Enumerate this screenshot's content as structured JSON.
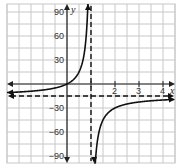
{
  "chart_data": {
    "type": "line",
    "title": "",
    "xlabel": "x",
    "ylabel": "y",
    "xlim": [
      -2.5,
      4.5
    ],
    "ylim": [
      -105,
      105
    ],
    "grid": true,
    "x_ticks": [
      {
        "value": 1,
        "label": ""
      },
      {
        "value": 2,
        "label": "2"
      },
      {
        "value": 3,
        "label": "3"
      },
      {
        "value": 4,
        "label": "4"
      }
    ],
    "y_ticks": [
      {
        "value": 90,
        "label": "90"
      },
      {
        "value": 60,
        "label": "60"
      },
      {
        "value": 30,
        "label": "30"
      },
      {
        "value": -30,
        "label": "−30"
      },
      {
        "value": -60,
        "label": "−60"
      },
      {
        "value": -90,
        "label": "−90"
      }
    ],
    "function": "y = -15x/(x-1)",
    "asymptotes": {
      "vertical": {
        "x": 1,
        "style": "dashed"
      },
      "horizontal": {
        "y": -15,
        "style": "dashed"
      }
    },
    "series": [
      {
        "name": "left branch",
        "x": [
          -2.5,
          -2,
          -1.5,
          -1,
          -0.5,
          0,
          0.3,
          0.5,
          0.7,
          0.8,
          0.85
        ],
        "y": [
          -10.7,
          -10,
          -9,
          -7.5,
          -5,
          0,
          6.4,
          15,
          35,
          60,
          85
        ]
      },
      {
        "name": "right branch",
        "x": [
          1.15,
          1.2,
          1.3,
          1.5,
          2,
          2.5,
          3,
          3.5,
          4,
          4.5
        ],
        "y": [
          -115,
          -90,
          -65,
          -45,
          -30,
          -25,
          -22.5,
          -21,
          -20,
          -19.3
        ]
      }
    ]
  },
  "axes": {
    "x_label": "x",
    "y_label": "y"
  },
  "colors": {
    "grid": "#c8c8c8",
    "axis": "#222222",
    "curve": "#111111",
    "asymptote": "#111111"
  }
}
